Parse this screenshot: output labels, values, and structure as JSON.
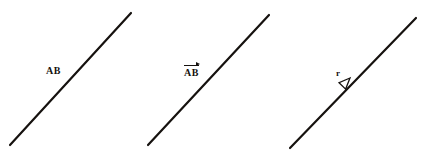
{
  "canvas": {
    "width": 425,
    "height": 163,
    "background_color": "#ffffff",
    "ink_color": "#16120f"
  },
  "figures": [
    {
      "id": "figure-segment-ab",
      "label_text": "AB",
      "notation": "plain",
      "label_x": 46,
      "label_y": 66,
      "line": {
        "x1": 10,
        "y1": 145,
        "x2": 131,
        "y2": 13
      },
      "stroke_width": 2.2,
      "has_arrowhead": false
    },
    {
      "id": "figure-vector-ab",
      "label_text": "AB",
      "notation": "vector-overline-arrow",
      "label_x": 184,
      "label_y": 68,
      "line": {
        "x1": 148,
        "y1": 145,
        "x2": 269,
        "y2": 15
      },
      "stroke_width": 2.2,
      "has_arrowhead": false
    },
    {
      "id": "figure-directed-r",
      "label_text": "r",
      "notation": "inline-open-arrowhead",
      "label_x": 336,
      "label_y": 69,
      "line": {
        "x1": 290,
        "y1": 148,
        "x2": 416,
        "y2": 18
      },
      "stroke_width": 2.2,
      "has_arrowhead": true,
      "arrowhead": {
        "tip_x": 355,
        "tip_y": 73,
        "style": "hollow-triangle",
        "direction": "up-right"
      }
    }
  ]
}
